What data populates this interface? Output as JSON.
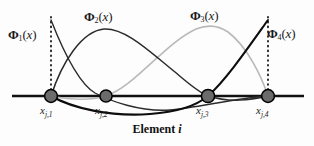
{
  "figure": {
    "caption_prefix": "Element",
    "caption_index": "i",
    "background": "#fdfdfd"
  },
  "colors": {
    "axis": "#111111",
    "node_fill": "#6b6b6b",
    "node_stroke": "#000000",
    "dotted_guide": "#2b2b2b",
    "curve_dark": "#2b2b2b",
    "curve_light": "#b9b9b9",
    "curve_black": "#0d0d0d",
    "text": "#1a1a1a"
  },
  "function_labels": [
    {
      "id": "phi1",
      "symbol": "Φ",
      "subscript": "1",
      "argument": "(x)",
      "text": "Φ1(x)",
      "x": 8,
      "y": 27
    },
    {
      "id": "phi2",
      "symbol": "Φ",
      "subscript": "2",
      "argument": "(x)",
      "text": "Φ2(x)",
      "x": 84,
      "y": 9
    },
    {
      "id": "phi3",
      "symbol": "Φ",
      "subscript": "3",
      "argument": "(x)",
      "text": "Φ3(x)",
      "x": 190,
      "y": 8
    },
    {
      "id": "phi4",
      "symbol": "Φ",
      "subscript": "4",
      "argument": "(x)",
      "text": "Φ4(x)",
      "x": 267,
      "y": 26
    }
  ],
  "node_labels": [
    {
      "id": "xj1",
      "symbol": "x",
      "subscript": "j,1",
      "text": "xj,1",
      "x": 40,
      "y": 104
    },
    {
      "id": "xj2",
      "symbol": "x",
      "subscript": "j,2",
      "text": "xj,2",
      "x": 95,
      "y": 104
    },
    {
      "id": "xj3",
      "symbol": "x",
      "subscript": "j,3",
      "text": "xj,3",
      "x": 196,
      "y": 104
    },
    {
      "id": "xj4",
      "symbol": "x",
      "subscript": "j,4",
      "text": "xj,4",
      "x": 256,
      "y": 104
    }
  ],
  "chart_data": {
    "type": "line",
    "xlabel": "Element i",
    "ylabel": "",
    "grid": false,
    "legend": "inline-annotations",
    "axis_y_pixel": 96,
    "xlim_pixel": [
      12,
      304
    ],
    "node_positions_pixel": [
      51,
      106,
      208,
      268
    ],
    "node_labels": [
      "x_{j,1}",
      "x_{j,2}",
      "x_{j,3}",
      "x_{j,4}"
    ],
    "node_radius_pixel": 6.5,
    "dotted_guides_pixel": [
      {
        "x": 51,
        "y_top": 17,
        "y_bottom": 96
      },
      {
        "x": 268,
        "y_top": 17,
        "y_bottom": 96
      }
    ],
    "series": [
      {
        "name": "Φ1(x)",
        "color": "#2b2b2b",
        "width": 1.4,
        "nodal_values": [
          1,
          0,
          0,
          0
        ],
        "description": "Starts at value 1 above node 1, decreases through zero at node 2, small negative lobe, returns to zero at node 4",
        "path_pixel": "M 51 20 C 62 48, 78 83, 95 93 C 110 101, 140 112, 170 110 C 196 108, 236 98, 268 96"
      },
      {
        "name": "Φ2(x)",
        "color": "#2b2b2b",
        "width": 1.5,
        "nodal_values": [
          0,
          1,
          0,
          0
        ],
        "description": "Zero at node 1, rises to peak 1 near node 2, falls to zero at node 3 and node 4",
        "path_pixel": "M 51 96 C 62 62, 82 31, 104 29 C 126 28, 150 52, 175 72 C 188 83, 198 92, 208 96 C 230 103, 250 100, 268 96"
      },
      {
        "name": "Φ3(x)",
        "color": "#b9b9b9",
        "width": 1.6,
        "nodal_values": [
          0,
          0,
          1,
          0
        ],
        "description": "Zero at node 1 and node 2, rises to peak 1 near node 3, falls to zero at node 4",
        "path_pixel": "M 51 96 C 66 99, 86 102, 106 96 C 134 87, 164 44, 196 29 C 206 25, 218 25, 228 32 C 248 47, 262 78, 268 96"
      },
      {
        "name": "Φ4(x)",
        "color": "#0d0d0d",
        "width": 2.1,
        "nodal_values": [
          0,
          0,
          0,
          1
        ],
        "description": "Zero at nodes 1-3 with small negative lobe, rises steeply to value 1 at node 4",
        "path_pixel": "M 51 96 C 72 108, 110 117, 150 114 C 178 112, 196 106, 208 96 C 226 80, 248 48, 268 20"
      }
    ],
    "axis_arrows": false,
    "axis_extends_pixel": {
      "left": 12,
      "right": 304
    }
  }
}
